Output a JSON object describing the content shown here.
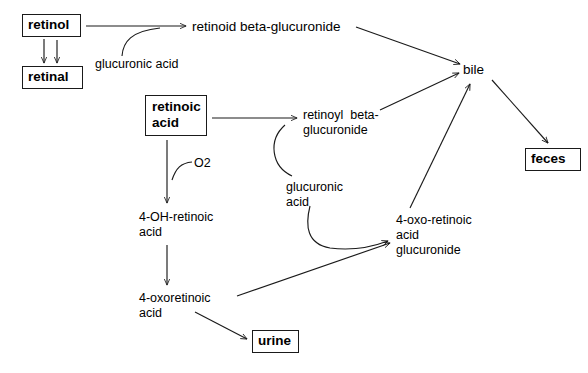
{
  "diagram": {
    "stroke_color": "#1a1a1a",
    "background_color": "#ffffff",
    "nodes": {
      "retinol": "retinol",
      "retinal": "retinal",
      "retinoic_acid": "retinoic\nacid",
      "retinoid_beta_glucuronide": "retinoid beta-glucuronide",
      "retinoyl_beta_glucuronide": "retinoyl  beta-\nglucuronide",
      "oh_retinoic_acid": "4-OH-retinoic\nacid",
      "oxoretinoic_acid": "4-oxoretinoic\nacid",
      "oxo_retinoic_acid_glucuronide": "4-oxo-retinoic\nacid\nglucuronide",
      "bile": "bile",
      "urine": "urine",
      "feces": "feces"
    },
    "edge_labels": {
      "glucuronic_acid_1": "glucuronic acid",
      "glucuronic_acid_2": "glucuronic\nacid",
      "oxygen": "O2"
    },
    "edges": [
      {
        "from": "retinol",
        "to": "retinal",
        "kind": "arrow"
      },
      {
        "from": "retinal",
        "to": "retinol",
        "kind": "arrow"
      },
      {
        "from": "retinol",
        "to": "retinoid_beta_glucuronide",
        "kind": "arrow",
        "label": "glucuronic acid"
      },
      {
        "from": "glucuronic_acid_1",
        "to": "retinol-to-retinoid-edge",
        "kind": "curve"
      },
      {
        "from": "retinoid_beta_glucuronide",
        "to": "bile",
        "kind": "arrow"
      },
      {
        "from": "retinoic_acid",
        "to": "retinoyl_beta_glucuronide",
        "kind": "arrow",
        "label": "glucuronic acid"
      },
      {
        "from": "glucuronic_acid_2",
        "to": "retinoic-acid-to-retinoyl-edge",
        "kind": "curve"
      },
      {
        "from": "retinoyl_beta_glucuronide",
        "to": "bile",
        "kind": "arrow"
      },
      {
        "from": "retinoic_acid",
        "to": "oh_retinoic_acid",
        "kind": "arrow",
        "label": "O2"
      },
      {
        "from": "oxygen",
        "to": "retinoic-acid-to-oh-edge",
        "kind": "curve"
      },
      {
        "from": "oh_retinoic_acid",
        "to": "oxoretinoic_acid",
        "kind": "arrow"
      },
      {
        "from": "oxoretinoic_acid",
        "to": "oxo_retinoic_acid_glucuronide",
        "kind": "arrow"
      },
      {
        "from": "glucuronic_acid_2",
        "to": "oxo_retinoic_acid_glucuronide",
        "kind": "curve-arrow"
      },
      {
        "from": "oxo_retinoic_acid_glucuronide",
        "to": "bile",
        "kind": "arrow"
      },
      {
        "from": "oxoretinoic_acid",
        "to": "urine",
        "kind": "arrow"
      },
      {
        "from": "bile",
        "to": "feces",
        "kind": "arrow"
      }
    ]
  }
}
